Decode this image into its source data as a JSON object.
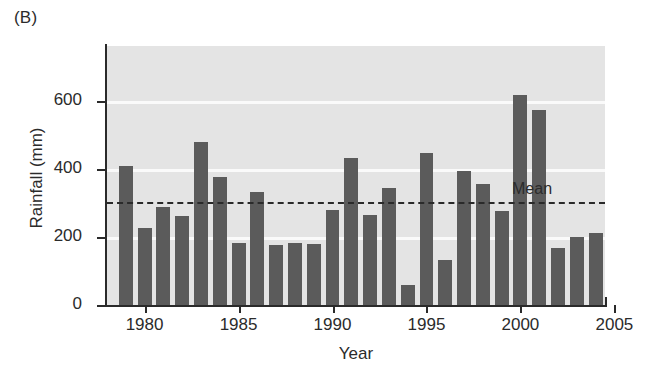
{
  "panel": {
    "label": "(B)"
  },
  "chart_data": {
    "type": "bar",
    "title": "",
    "xlabel": "Year",
    "ylabel": "Rainfall (mm)",
    "xlim": [
      1978.5,
      2005.0
    ],
    "ylim": [
      0,
      760
    ],
    "yticks": [
      0,
      200,
      400,
      600
    ],
    "ytick_labels": [
      "0",
      "200",
      "400",
      "600"
    ],
    "xticks": [
      1980,
      1985,
      1990,
      1995,
      2000,
      2005
    ],
    "xtick_labels": [
      "1980",
      "1985",
      "1990",
      "1995",
      "2000",
      "2005"
    ],
    "grid": "horizontal-white-at-yticks",
    "legend": "none",
    "categories": [
      1979,
      1980,
      1981,
      1982,
      1983,
      1984,
      1985,
      1986,
      1987,
      1988,
      1989,
      1990,
      1991,
      1992,
      1993,
      1994,
      1995,
      1996,
      1997,
      1998,
      1999,
      2000,
      2001,
      2002,
      2003,
      2004
    ],
    "values": [
      408,
      225,
      288,
      260,
      478,
      375,
      182,
      333,
      175,
      183,
      180,
      280,
      430,
      263,
      342,
      60,
      447,
      133,
      392,
      355,
      275,
      617,
      573,
      168,
      200,
      212
    ],
    "bar_color": "#5b5b5b",
    "plot_background": "#e4e4e4",
    "annotations": [
      {
        "name": "mean-line",
        "type": "hline",
        "value": 301,
        "label": "Mean",
        "style": "dashed",
        "color": "#2a2a2a"
      }
    ]
  }
}
